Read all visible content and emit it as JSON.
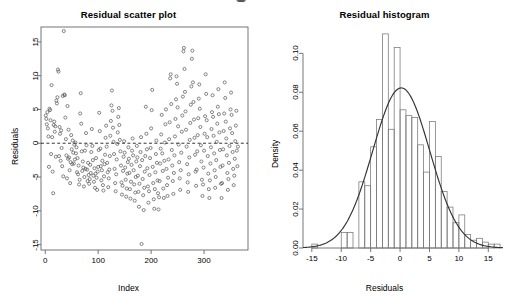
{
  "figure": {
    "width": 513,
    "height": 301,
    "background": "#ffffff",
    "foreground": "#000000",
    "point_color": "#555555",
    "curve_color": "#333333",
    "bar_color": "#777777"
  },
  "panels": {
    "scatter": {
      "title": "Residual scatter plot",
      "xlabel": "Index",
      "ylabel": "Residuals",
      "xticks": [
        "0",
        "100",
        "200",
        "300"
      ],
      "yticks": [
        "-15",
        "-10",
        "-5",
        "0",
        "5",
        "10",
        "15"
      ]
    },
    "histogram": {
      "title": "Residual histogram",
      "xlabel": "Residuals",
      "ylabel": "Density",
      "xticks": [
        "-15",
        "-10",
        "-5",
        "0",
        "5",
        "10",
        "15"
      ],
      "yticks": [
        "0.00",
        "0.02",
        "0.04",
        "0.06",
        "0.08",
        "0.10"
      ]
    }
  },
  "chart_data": [
    {
      "type": "scatter",
      "title": "Residual scatter plot",
      "xlabel": "Index",
      "ylabel": "Residuals",
      "xlim": [
        -8,
        383
      ],
      "ylim": [
        -15.8,
        17.2
      ],
      "xticks": [
        0,
        100,
        200,
        300
      ],
      "yticks": [
        -15,
        -10,
        -5,
        0,
        5,
        10,
        15
      ],
      "grid": false,
      "legend": null,
      "reference_line": {
        "y": 0,
        "style": "dashed",
        "color": "#000000"
      },
      "marker": "open-circle",
      "x": [
        1,
        2,
        3,
        4,
        5,
        6,
        7,
        8,
        9,
        10,
        11,
        12,
        13,
        14,
        15,
        16,
        17,
        18,
        19,
        20,
        21,
        22,
        23,
        24,
        25,
        26,
        27,
        28,
        29,
        30,
        31,
        32,
        33,
        34,
        35,
        36,
        37,
        38,
        39,
        40,
        41,
        42,
        43,
        44,
        45,
        46,
        47,
        48,
        49,
        50,
        51,
        52,
        53,
        54,
        55,
        56,
        57,
        58,
        59,
        60,
        61,
        62,
        63,
        64,
        65,
        66,
        67,
        68,
        69,
        70,
        71,
        72,
        73,
        74,
        75,
        76,
        77,
        78,
        79,
        80,
        81,
        82,
        83,
        84,
        85,
        86,
        87,
        88,
        89,
        90,
        91,
        92,
        93,
        94,
        95,
        96,
        97,
        98,
        99,
        100,
        101,
        102,
        103,
        104,
        105,
        106,
        107,
        108,
        109,
        110,
        111,
        112,
        113,
        114,
        115,
        116,
        117,
        118,
        119,
        120,
        121,
        122,
        123,
        124,
        125,
        126,
        127,
        128,
        129,
        130,
        131,
        132,
        133,
        134,
        135,
        136,
        137,
        138,
        139,
        140,
        141,
        142,
        143,
        144,
        145,
        146,
        147,
        148,
        149,
        150,
        151,
        152,
        153,
        154,
        155,
        156,
        157,
        158,
        159,
        160,
        161,
        162,
        163,
        164,
        165,
        166,
        167,
        168,
        169,
        170,
        171,
        172,
        173,
        174,
        175,
        176,
        177,
        178,
        179,
        180,
        181,
        182,
        183,
        184,
        185,
        186,
        187,
        188,
        189,
        190,
        191,
        192,
        193,
        194,
        195,
        196,
        197,
        198,
        199,
        200,
        201,
        202,
        203,
        204,
        205,
        206,
        207,
        208,
        209,
        210,
        211,
        212,
        213,
        214,
        215,
        216,
        217,
        218,
        219,
        220,
        221,
        222,
        223,
        224,
        225,
        226,
        227,
        228,
        229,
        230,
        231,
        232,
        233,
        234,
        235,
        236,
        237,
        238,
        239,
        240,
        241,
        242,
        243,
        244,
        245,
        246,
        247,
        248,
        249,
        250,
        251,
        252,
        253,
        254,
        255,
        256,
        257,
        258,
        259,
        260,
        261,
        262,
        263,
        264,
        265,
        266,
        267,
        268,
        269,
        270,
        271,
        272,
        273,
        274,
        275,
        276,
        277,
        278,
        279,
        280,
        281,
        282,
        283,
        284,
        285,
        286,
        287,
        288,
        289,
        290,
        291,
        292,
        293,
        294,
        295,
        296,
        297,
        298,
        299,
        300,
        301,
        302,
        303,
        304,
        305,
        306,
        307,
        308,
        309,
        310,
        311,
        312,
        313,
        314,
        315,
        316,
        317,
        318,
        319,
        320,
        321,
        322,
        323,
        324,
        325,
        326,
        327,
        328,
        329,
        330,
        331,
        332,
        333,
        334,
        335,
        336,
        337,
        338,
        339,
        340,
        341,
        342,
        343,
        344,
        345,
        346,
        347,
        348,
        349,
        350,
        351,
        352,
        353,
        354,
        355,
        356,
        357,
        358,
        359,
        360,
        361,
        362,
        363,
        364,
        365,
        366,
        367,
        368,
        369,
        370,
        371,
        372,
        373,
        374,
        375
      ],
      "y": [
        4.1,
        3.6,
        2.8,
        4.6,
        2.2,
        1.0,
        -3.5,
        5.1,
        4.9,
        3.4,
        -1.6,
        8.6,
        0.9,
        -4.2,
        -7.4,
        2.7,
        3.2,
        1.7,
        2.5,
        -2.0,
        6.3,
        5.9,
        6.8,
        10.9,
        10.6,
        -1.9,
        2.4,
        1.4,
        -2.6,
        1.9,
        -0.7,
        -3.4,
        7.0,
        -4.9,
        16.6,
        7.2,
        7.1,
        3.8,
        0.6,
        -1.8,
        -5.2,
        5.5,
        -2.3,
        2.0,
        -2.1,
        -4.0,
        -5.9,
        -2.8,
        1.2,
        -0.9,
        -3.1,
        0.4,
        -1.4,
        -3.0,
        -0.2,
        -2.4,
        0.1,
        -1.5,
        -0.6,
        -4.3,
        -2.2,
        -4.6,
        -3.3,
        -6.1,
        -5.4,
        4.4,
        7.4,
        2.9,
        -1.2,
        -4.1,
        -2.7,
        -3.6,
        -6.4,
        -5.0,
        -1.1,
        -3.8,
        1.5,
        -0.3,
        -3.9,
        -5.6,
        -2.9,
        -4.7,
        -6.0,
        -5.3,
        -3.2,
        -4.4,
        -1.3,
        2.1,
        -0.4,
        -2.5,
        -4.8,
        -5.7,
        -3.7,
        -6.6,
        -4.5,
        -2.2,
        -5.1,
        -6.9,
        -4.2,
        -3.5,
        -1.0,
        4.5,
        1.8,
        -0.8,
        -3.4,
        -5.5,
        -4.0,
        -2.6,
        -6.2,
        -7.0,
        -4.9,
        -3.1,
        -1.7,
        0.8,
        2.6,
        -0.5,
        -2.9,
        -4.3,
        -6.5,
        -5.2,
        -3.9,
        -1.9,
        1.1,
        3.3,
        5.6,
        7.8,
        4.8,
        2.3,
        0.2,
        -1.6,
        -3.8,
        -5.9,
        -7.1,
        -4.6,
        -2.4,
        -0.1,
        1.6,
        3.9,
        5.2,
        2.7,
        0.5,
        -1.2,
        -3.3,
        -5.8,
        -7.6,
        -6.3,
        -4.1,
        -2.0,
        0.3,
        -1.4,
        -3.6,
        -5.4,
        -7.9,
        -6.7,
        -4.5,
        -2.8,
        -0.6,
        -2.3,
        -4.4,
        -6.8,
        -8.2,
        -5.7,
        -3.2,
        -1.1,
        0.7,
        -1.8,
        -4.0,
        -6.1,
        -8.5,
        -7.3,
        -5.0,
        -2.7,
        -0.4,
        -2.1,
        -4.8,
        -7.2,
        -9.4,
        -6.0,
        -3.4,
        -1.3,
        0.9,
        -14.9,
        -2.5,
        -5.3,
        -7.7,
        -9.9,
        -6.6,
        -4.2,
        -1.9,
        5.4,
        1.4,
        -0.9,
        -3.7,
        -6.4,
        -8.8,
        -7.1,
        -4.7,
        -2.2,
        -0.7,
        2.2,
        4.9,
        7.9,
        -3.5,
        -5.9,
        -8.3,
        -9.7,
        -6.8,
        -4.3,
        -1.6,
        0.4,
        -2.9,
        -5.5,
        -7.4,
        -9.8,
        -8.0,
        -5.6,
        -3.0,
        -0.8,
        1.3,
        4.2,
        -1.5,
        -4.1,
        -6.7,
        -8.1,
        -2.6,
        0.1,
        2.8,
        5.0,
        -3.8,
        -6.2,
        -7.8,
        -5.1,
        -2.4,
        0.6,
        3.1,
        9.6,
        10.2,
        5.8,
        -1.0,
        -3.3,
        -5.6,
        -7.5,
        -4.4,
        -1.8,
        1.0,
        3.6,
        6.5,
        9.9,
        8.8,
        5.3,
        2.5,
        -0.2,
        -2.8,
        -5.2,
        -6.9,
        -4.0,
        -1.4,
        1.7,
        4.1,
        6.9,
        13.6,
        14.1,
        11.0,
        7.6,
        4.7,
        2.0,
        -0.5,
        -3.1,
        -5.8,
        -7.2,
        -4.6,
        -2.1,
        0.5,
        3.0,
        5.7,
        8.4,
        12.5,
        13.7,
        9.0,
        6.1,
        3.5,
        0.8,
        -1.7,
        -4.2,
        -6.3,
        -3.9,
        -1.2,
        1.2,
        3.7,
        6.6,
        8.7,
        5.1,
        2.4,
        -0.3,
        -2.7,
        -5.4,
        -7.8,
        -6.1,
        -3.6,
        -1.1,
        1.4,
        4.0,
        10.2,
        7.3,
        3.4,
        0.9,
        -1.9,
        -4.5,
        -6.8,
        -8.1,
        -5.5,
        -3.0,
        -0.6,
        2.1,
        4.6,
        7.1,
        3.9,
        1.1,
        -1.5,
        -4.0,
        -6.6,
        -5.0,
        -2.5,
        0.2,
        2.9,
        5.4,
        8.0,
        4.3,
        1.6,
        -1.0,
        -3.5,
        -6.0,
        -8.1,
        -5.9,
        -3.3,
        -0.9,
        1.8,
        4.4,
        9.0,
        6.7,
        3.2,
        0.7,
        -1.8,
        -4.4,
        -6.9,
        -5.3,
        -2.9,
        -0.4,
        2.2,
        5.0,
        7.5,
        4.2,
        1.5,
        -1.3,
        -3.8,
        -6.2,
        -4.8,
        -2.3,
        0.3,
        2.6,
        4.8,
        -1.1,
        -3.4,
        -0.5
      ]
    },
    {
      "type": "histogram",
      "title": "Residual histogram",
      "xlabel": "Residuals",
      "ylabel": "Density",
      "xlim": [
        -16.5,
        17.5
      ],
      "ylim": [
        0,
        0.112
      ],
      "xticks": [
        -15,
        -10,
        -5,
        0,
        5,
        10,
        15
      ],
      "yticks": [
        0.0,
        0.02,
        0.04,
        0.06,
        0.08,
        0.1
      ],
      "grid": false,
      "legend": null,
      "bin_width": 1,
      "bin_edges": [
        -15,
        -14,
        -13,
        -12,
        -11,
        -10,
        -9,
        -8,
        -7,
        -6,
        -5,
        -4,
        -3,
        -2,
        -1,
        0,
        1,
        2,
        3,
        4,
        5,
        6,
        7,
        8,
        9,
        10,
        11,
        12,
        13,
        14,
        15,
        16,
        17
      ],
      "densities": [
        0.002,
        0.0,
        0.0,
        0.0,
        0.0,
        0.008,
        0.008,
        0.0,
        0.034,
        0.032,
        0.052,
        0.066,
        0.11,
        0.061,
        0.103,
        0.071,
        0.068,
        0.067,
        0.053,
        0.039,
        0.065,
        0.047,
        0.029,
        0.021,
        0.013,
        0.017,
        0.007,
        0.004,
        0.005,
        0.003,
        0.002,
        0.002
      ],
      "overlay_curve": {
        "type": "normal-density",
        "mean": 0.2,
        "sd": 4.85,
        "peak_density": 0.082,
        "color": "#333333"
      }
    }
  ]
}
